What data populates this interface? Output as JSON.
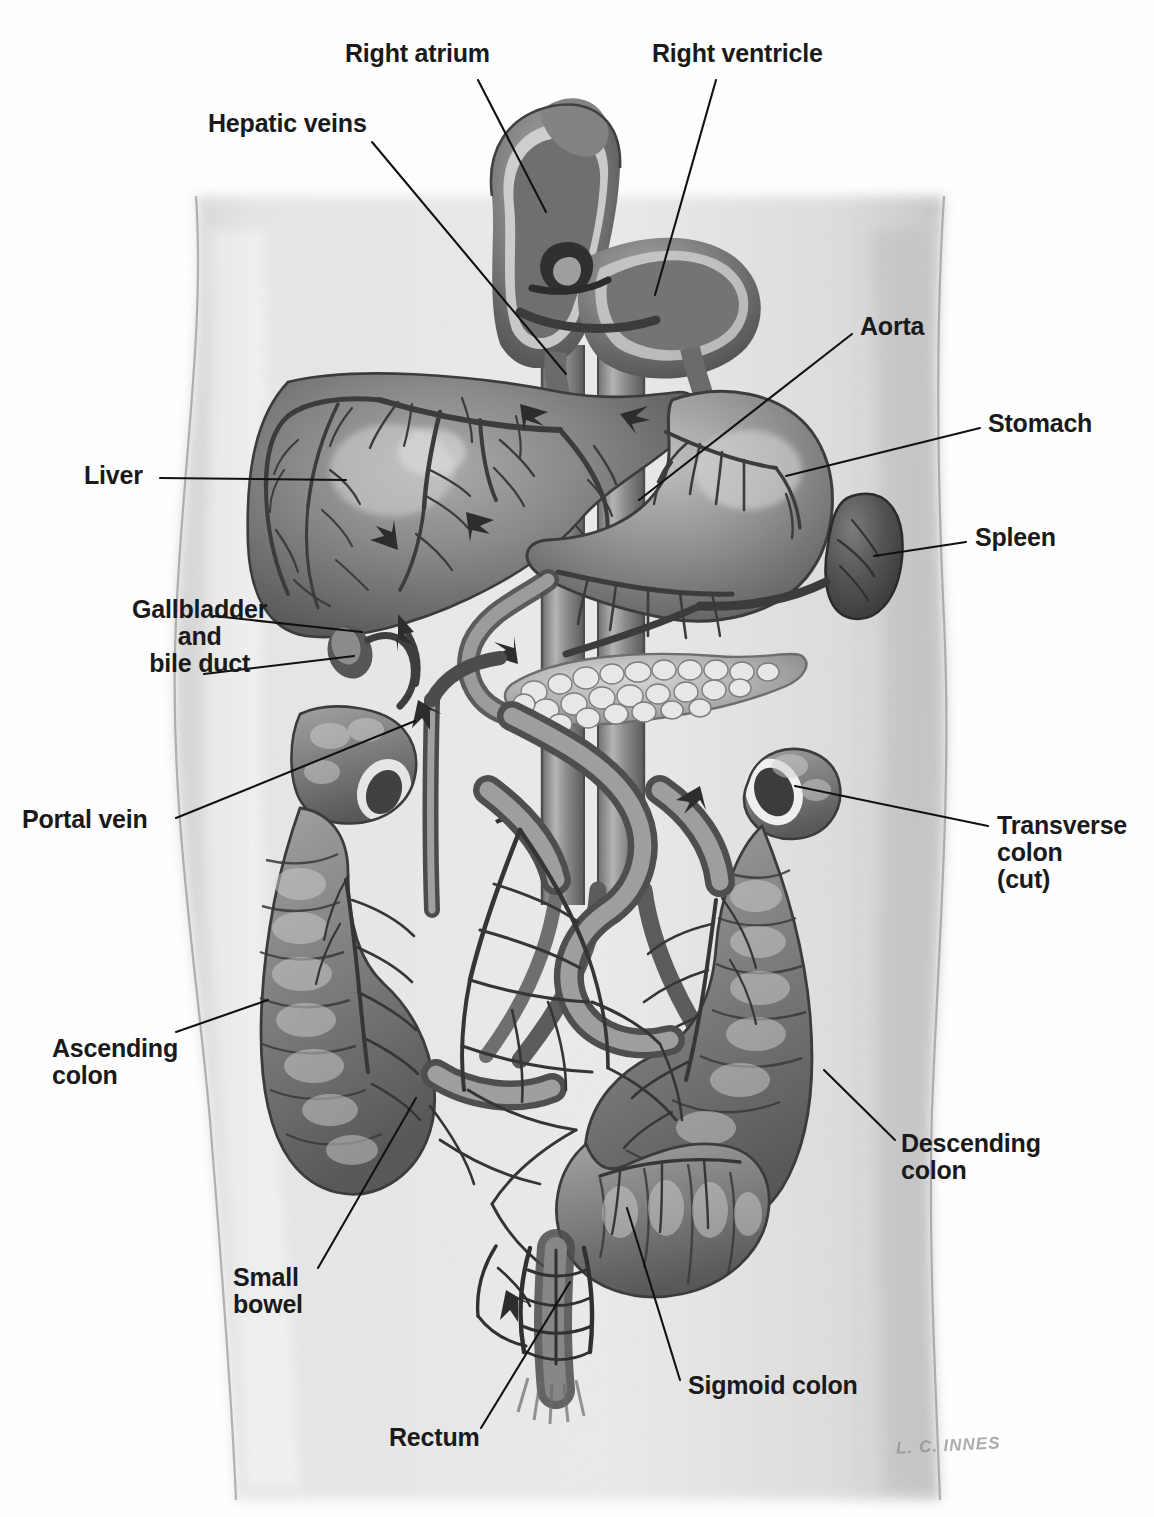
{
  "illustration": {
    "title": "Abdominal organs and portal venous circulation",
    "signature": "L. C. INNES",
    "palette": {
      "background": "#ffffff",
      "torso": "#e0e0e0",
      "torso_shadow": "#c9c9c9",
      "organ_mid": "#8e8e8e",
      "organ_dark": "#5a5a5a",
      "organ_light": "#b9b9b9",
      "vessel": "#3d3d3d",
      "label_text": "#1a1a1a",
      "leader_line": "#111111"
    }
  },
  "labels": [
    {
      "id": "right-atrium",
      "lines": [
        "Right atrium"
      ],
      "x": 345,
      "y": 40,
      "size": 25,
      "align": "left"
    },
    {
      "id": "right-ventricle",
      "lines": [
        "Right ventricle"
      ],
      "x": 652,
      "y": 40,
      "size": 25,
      "align": "left"
    },
    {
      "id": "hepatic-veins",
      "lines": [
        "Hepatic veins"
      ],
      "x": 208,
      "y": 110,
      "size": 25,
      "align": "left"
    },
    {
      "id": "aorta",
      "lines": [
        "Aorta"
      ],
      "x": 860,
      "y": 313,
      "size": 25,
      "align": "left"
    },
    {
      "id": "stomach",
      "lines": [
        "Stomach"
      ],
      "x": 988,
      "y": 410,
      "size": 25,
      "align": "left"
    },
    {
      "id": "spleen",
      "lines": [
        "Spleen"
      ],
      "x": 975,
      "y": 524,
      "size": 25,
      "align": "left"
    },
    {
      "id": "liver",
      "lines": [
        "Liver"
      ],
      "x": 84,
      "y": 462,
      "size": 25,
      "align": "left"
    },
    {
      "id": "gallbladder",
      "lines": [
        "Gallbladder",
        "and",
        "bile duct"
      ],
      "x": 132,
      "y": 596,
      "size": 25,
      "align": "center"
    },
    {
      "id": "portal-vein",
      "lines": [
        "Portal vein"
      ],
      "x": 22,
      "y": 806,
      "size": 25,
      "align": "left"
    },
    {
      "id": "transverse-colon",
      "lines": [
        "Transverse",
        "colon",
        "(cut)"
      ],
      "x": 997,
      "y": 812,
      "size": 25,
      "align": "left"
    },
    {
      "id": "ascending-colon",
      "lines": [
        "Ascending",
        "colon"
      ],
      "x": 52,
      "y": 1035,
      "size": 25,
      "align": "left"
    },
    {
      "id": "descending-colon",
      "lines": [
        "Descending",
        "colon"
      ],
      "x": 901,
      "y": 1130,
      "size": 25,
      "align": "left"
    },
    {
      "id": "small-bowel",
      "lines": [
        "Small",
        "bowel"
      ],
      "x": 233,
      "y": 1264,
      "size": 25,
      "align": "left"
    },
    {
      "id": "sigmoid-colon",
      "lines": [
        "Sigmoid colon"
      ],
      "x": 688,
      "y": 1372,
      "size": 25,
      "align": "left"
    },
    {
      "id": "rectum",
      "lines": [
        "Rectum"
      ],
      "x": 389,
      "y": 1424,
      "size": 25,
      "align": "left"
    }
  ],
  "leader_lines": [
    {
      "id": "leader-right-atrium",
      "points": "478,80 546,212"
    },
    {
      "id": "leader-right-ventricle",
      "points": "716,80 655,295"
    },
    {
      "id": "leader-hepatic-veins",
      "points": "372,142 566,374"
    },
    {
      "id": "leader-aorta",
      "points": "852,334 639,500"
    },
    {
      "id": "leader-stomach",
      "points": "980,428 786,476"
    },
    {
      "id": "leader-spleen",
      "points": "966,542 874,556"
    },
    {
      "id": "leader-liver",
      "points": "160,478 346,480"
    },
    {
      "id": "leader-gallbladder-1",
      "points": "214,616 362,632"
    },
    {
      "id": "leader-gallbladder-2",
      "points": "204,674 354,656"
    },
    {
      "id": "leader-portal-vein",
      "points": "176,818 415,721"
    },
    {
      "id": "leader-transverse-colon",
      "points": "988,826 795,786"
    },
    {
      "id": "leader-ascending-colon",
      "points": "176,1032 268,1000"
    },
    {
      "id": "leader-descending-colon",
      "points": "895,1140 824,1070"
    },
    {
      "id": "leader-small-bowel",
      "points": "318,1268 416,1098"
    },
    {
      "id": "leader-sigmoid-colon",
      "points": "680,1380 627,1208"
    },
    {
      "id": "leader-rectum",
      "points": "481,1428 570,1282"
    }
  ],
  "structures": [
    {
      "id": "heart",
      "name": "Heart (right atrium and right ventricle, cut open)"
    },
    {
      "id": "inferior-vena-cava",
      "name": "Inferior vena cava"
    },
    {
      "id": "aorta-vessel",
      "name": "Aorta"
    },
    {
      "id": "liver-organ",
      "name": "Liver"
    },
    {
      "id": "gallbladder-organ",
      "name": "Gallbladder and bile duct"
    },
    {
      "id": "stomach-organ",
      "name": "Stomach"
    },
    {
      "id": "spleen-organ",
      "name": "Spleen"
    },
    {
      "id": "pancreas-organ",
      "name": "Pancreas"
    },
    {
      "id": "portal-vein-vessel",
      "name": "Portal vein"
    },
    {
      "id": "ascending-colon-organ",
      "name": "Ascending colon"
    },
    {
      "id": "transverse-colon-organ",
      "name": "Transverse colon (cut)"
    },
    {
      "id": "descending-colon-organ",
      "name": "Descending colon"
    },
    {
      "id": "sigmoid-colon-organ",
      "name": "Sigmoid colon"
    },
    {
      "id": "small-bowel-organ",
      "name": "Small bowel"
    },
    {
      "id": "rectum-organ",
      "name": "Rectum"
    }
  ],
  "flow_arrows": [
    {
      "id": "arrow-liver-left",
      "note": "blood flow in liver, pointing left"
    },
    {
      "id": "arrow-liver-right",
      "note": "blood flow in liver, pointing right"
    },
    {
      "id": "arrow-portal-up",
      "note": "portal vein flow, pointing up"
    },
    {
      "id": "arrow-splenic",
      "note": "splenic vein flow, pointing left"
    },
    {
      "id": "arrow-mesenteric",
      "note": "superior mesenteric flow, pointing up-left"
    },
    {
      "id": "arrow-rectal-up",
      "note": "rectal venous flow, pointing up"
    }
  ]
}
